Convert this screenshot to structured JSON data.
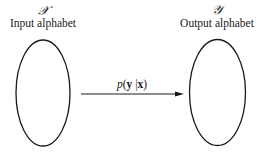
{
  "diagram": {
    "input": {
      "symbol": "𝒳",
      "label": "Input alphabet"
    },
    "output": {
      "symbol": "𝒴",
      "label": "Output alphabet"
    },
    "channel": {
      "label_fn": "p",
      "label_open": "(",
      "label_y": "y",
      "label_sep": " |",
      "label_x": "x",
      "label_close": ")"
    },
    "colors": {
      "stroke": "#1a1a1a",
      "background": "#ffffff"
    }
  }
}
